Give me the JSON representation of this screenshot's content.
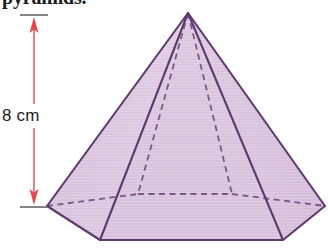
{
  "heading": {
    "text": "pyramids."
  },
  "dimension": {
    "label": "8 cm",
    "value": 8,
    "unit": "cm",
    "orientation": "vertical",
    "arrow_color": "#e8737a",
    "tick_color": "#555555"
  },
  "figure": {
    "name": "hexagonal-pyramid",
    "fill_color": "#dcc8e0",
    "fill_color_shaded": "#d3bbd9",
    "edge_color": "#5e3a6e",
    "hidden_edge_color": "#6b4478",
    "hidden_edge_style": "dashed"
  },
  "geometry": {
    "apex": [
      188,
      13
    ],
    "base_vertices": [
      [
        47,
        206
      ],
      [
        100,
        240
      ],
      [
        283,
        240
      ],
      [
        325,
        206
      ],
      [
        232,
        194
      ],
      [
        138,
        194
      ]
    ],
    "visible_edges": [
      [
        [
          188,
          13
        ],
        [
          47,
          206
        ]
      ],
      [
        [
          188,
          13
        ],
        [
          100,
          240
        ]
      ],
      [
        [
          188,
          13
        ],
        [
          283,
          240
        ]
      ],
      [
        [
          188,
          13
        ],
        [
          325,
          206
        ]
      ],
      [
        [
          47,
          206
        ],
        [
          100,
          240
        ]
      ],
      [
        [
          100,
          240
        ],
        [
          283,
          240
        ]
      ],
      [
        [
          283,
          240
        ],
        [
          325,
          206
        ]
      ]
    ],
    "hidden_edges": [
      [
        [
          188,
          13
        ],
        [
          138,
          194
        ]
      ],
      [
        [
          188,
          13
        ],
        [
          232,
          194
        ]
      ],
      [
        [
          47,
          206
        ],
        [
          138,
          194
        ]
      ],
      [
        [
          138,
          194
        ],
        [
          232,
          194
        ]
      ],
      [
        [
          232,
          194
        ],
        [
          325,
          206
        ]
      ]
    ],
    "dimension_line": {
      "x": 34,
      "y_top": 16,
      "y_bottom": 206,
      "tick_top": [
        20,
        48
      ],
      "tick_bottom": [
        20,
        48
      ]
    }
  }
}
